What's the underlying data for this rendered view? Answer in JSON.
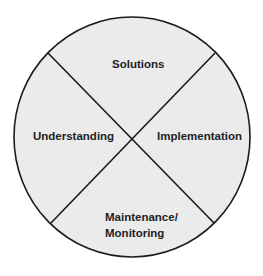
{
  "diagram": {
    "type": "quadrant-circle",
    "colors": {
      "fill": "#ebebeb",
      "stroke": "#1a1a1a",
      "background": "#ffffff"
    },
    "segments": [
      {
        "position": "top",
        "label": "Solutions"
      },
      {
        "position": "left",
        "label": "Understanding"
      },
      {
        "position": "right",
        "label": "Implementation"
      },
      {
        "position": "bottom",
        "label_line1": "Maintenance/",
        "label_line2": "Monitoring"
      }
    ]
  }
}
